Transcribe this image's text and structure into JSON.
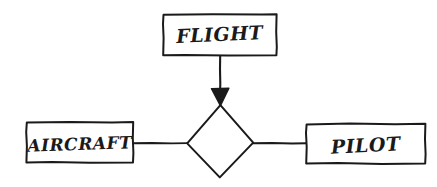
{
  "diagram": {
    "type": "er-diagram",
    "style": "hand-drawn-sketch",
    "background_color": "#ffffff",
    "stroke_color": "#1a1a1a",
    "entities": [
      {
        "id": "flight",
        "label": "FLIGHT",
        "shape": "rectangle",
        "position": "top-center"
      },
      {
        "id": "aircraft",
        "label": "AIRCRAFT",
        "shape": "rectangle",
        "position": "left"
      },
      {
        "id": "pilot",
        "label": "PILOT",
        "shape": "rectangle",
        "position": "right"
      }
    ],
    "relationship": {
      "id": "relationship-diamond",
      "label": "",
      "shape": "diamond",
      "position": "center"
    },
    "connectors": [
      {
        "id": "flight-to-relationship",
        "from": "flight",
        "to": "relationship-diamond",
        "arrowhead": "filled-triangle",
        "orientation": "vertical"
      },
      {
        "id": "aircraft-to-relationship",
        "from": "aircraft",
        "to": "relationship-diamond",
        "arrowhead": "none",
        "orientation": "horizontal"
      },
      {
        "id": "relationship-to-pilot",
        "from": "relationship-diamond",
        "to": "pilot",
        "arrowhead": "none",
        "orientation": "horizontal"
      }
    ]
  }
}
